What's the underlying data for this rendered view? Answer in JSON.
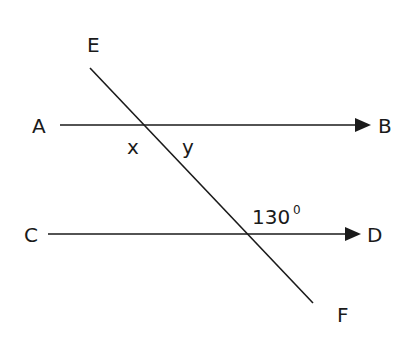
{
  "diagram": {
    "type": "parallel lines cut by a transversal",
    "colors": {
      "stroke": "#1a1a1a",
      "background": "#ffffff"
    },
    "lines": {
      "ab": {
        "start_label": "A",
        "end_label": "B",
        "arrow_at": "B"
      },
      "cd": {
        "start_label": "C",
        "end_label": "D",
        "arrow_at": "D"
      },
      "ef": {
        "start_label": "E",
        "end_label": "F",
        "type": "transversal"
      }
    },
    "points": {
      "A": "A",
      "B": "B",
      "C": "C",
      "D": "D",
      "E": "E",
      "F": "F"
    },
    "angles": {
      "x": "x",
      "y": "y",
      "given_value": "130",
      "given_unit": "0"
    }
  }
}
